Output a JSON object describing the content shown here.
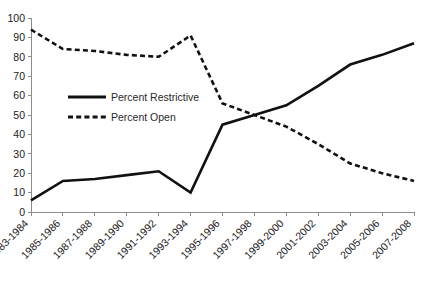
{
  "chart_data": {
    "type": "line",
    "title": "",
    "subtitle": "",
    "xlabel": "",
    "ylabel": "",
    "categories": [
      "1983-1984",
      "1985-1986",
      "1987-1988",
      "1989-1990",
      "1991-1992",
      "1993-1994",
      "1995-1996",
      "1997-1998",
      "1999-2000",
      "2001-2002",
      "2003-2004",
      "2005-2006",
      "2007-2008"
    ],
    "series": [
      {
        "name": "Percent Restrictive",
        "style": "solid",
        "values": [
          6,
          16,
          17,
          19,
          21,
          10,
          45,
          50,
          55,
          65,
          76,
          81,
          87
        ]
      },
      {
        "name": "Percent Open",
        "style": "dashed",
        "values": [
          94,
          84,
          83,
          81,
          80,
          91,
          56,
          50,
          44,
          35,
          25,
          20,
          16
        ]
      }
    ],
    "ylim": [
      0,
      100
    ],
    "ytick_values": [
      0,
      10,
      20,
      30,
      40,
      50,
      60,
      70,
      80,
      90,
      100
    ],
    "ytick_labels": [
      "0",
      "10",
      "20",
      "30",
      "40",
      "50",
      "60",
      "70",
      "80",
      "90",
      "100"
    ],
    "grid": false,
    "legend_position": "inside-upper-left",
    "legend_entries": [
      {
        "label": "Percent Restrictive",
        "style": "solid"
      },
      {
        "label": "Percent Open",
        "style": "dashed"
      }
    ]
  }
}
